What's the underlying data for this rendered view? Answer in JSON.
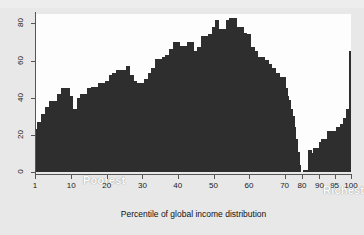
{
  "chart_data": {
    "type": "bar",
    "title": "",
    "subtitle": "",
    "xlabel": "Percentile of global income distribution",
    "ylabel": "",
    "xlim": [
      1,
      100
    ],
    "ylim": [
      0,
      85
    ],
    "grid": false,
    "legend": null,
    "x_axis_scale": "nonlinear-compressed-top",
    "bar_color": "#2e2e2e",
    "plot_background": "#fdfdfd",
    "figure_background": "#e8e8e8",
    "y_ticks": [
      0,
      20,
      40,
      60,
      80
    ],
    "x_ticks": [
      1,
      10,
      20,
      30,
      40,
      50,
      60,
      70,
      80,
      90,
      95,
      100
    ],
    "annotations": [
      {
        "text": "Poorest",
        "x": 6,
        "y": 10
      },
      {
        "text": "Richest",
        "x": 90,
        "y": 6
      }
    ],
    "categories": [
      1,
      2,
      3,
      4,
      5,
      6,
      7,
      8,
      9,
      10,
      11,
      12,
      13,
      14,
      15,
      16,
      17,
      18,
      19,
      20,
      21,
      22,
      23,
      24,
      25,
      26,
      27,
      28,
      29,
      30,
      31,
      32,
      33,
      34,
      35,
      36,
      37,
      38,
      39,
      40,
      41,
      42,
      43,
      44,
      45,
      46,
      47,
      48,
      49,
      50,
      51,
      52,
      53,
      54,
      55,
      56,
      57,
      58,
      59,
      60,
      61,
      62,
      63,
      64,
      65,
      66,
      67,
      68,
      69,
      70,
      71,
      72,
      73,
      74,
      75,
      76,
      77,
      78,
      79,
      80,
      81,
      82,
      83,
      84,
      85,
      86,
      87,
      88,
      89,
      90,
      91,
      92,
      93,
      94,
      95,
      96,
      97,
      98,
      99,
      100
    ],
    "values": [
      23,
      27,
      31,
      35,
      38,
      38,
      42,
      45,
      45,
      41,
      34,
      40,
      42,
      42,
      45,
      46,
      46,
      48,
      48,
      49,
      52,
      53,
      55,
      55,
      55,
      57,
      52,
      49,
      48,
      48,
      50,
      53,
      56,
      61,
      61,
      62,
      63,
      66,
      70,
      70,
      68,
      68,
      70,
      70,
      65,
      67,
      73,
      73,
      74,
      78,
      82,
      77,
      77,
      82,
      83,
      83,
      78,
      78,
      75,
      74,
      67,
      65,
      62,
      62,
      60,
      58,
      56,
      53,
      51,
      51,
      45,
      41,
      39,
      34,
      30,
      24,
      18,
      11,
      4,
      0,
      1,
      1,
      1,
      12,
      12,
      10,
      13,
      13,
      13,
      16,
      18,
      18,
      22,
      22,
      22,
      24,
      26,
      29,
      34,
      65
    ]
  }
}
